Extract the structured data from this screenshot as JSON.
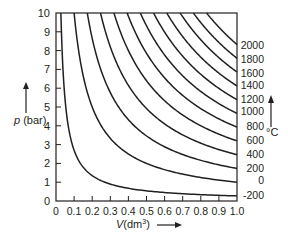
{
  "chart_data": {
    "type": "line",
    "title": "",
    "xlabel": "V (dm³)",
    "ylabel": "p (bar)",
    "secondary_label": "°C",
    "xlim": [
      0,
      1.0
    ],
    "ylim": [
      0,
      10
    ],
    "x_ticks": [
      "0",
      "0.1",
      "0.2",
      "0.3",
      "0.4",
      "0.5",
      "0.6",
      "0.7",
      "0.8",
      "0.9",
      "1.0"
    ],
    "y_ticks": [
      "0",
      "1",
      "2",
      "3",
      "4",
      "5",
      "6",
      "7",
      "8",
      "9",
      "10"
    ],
    "grid": false,
    "legend_position": "right (labels at curve ends)",
    "relation": "p = nR(T+273)/V, nR ≈ 0.00366 bar·dm³/K",
    "series": [
      {
        "name": "-200",
        "temperature_C": -200,
        "p_at_V1": 0.27
      },
      {
        "name": "0",
        "temperature_C": 0,
        "p_at_V1": 1.0
      },
      {
        "name": "200",
        "temperature_C": 200,
        "p_at_V1": 1.73
      },
      {
        "name": "400",
        "temperature_C": 400,
        "p_at_V1": 2.46
      },
      {
        "name": "600",
        "temperature_C": 600,
        "p_at_V1": 3.2
      },
      {
        "name": "800",
        "temperature_C": 800,
        "p_at_V1": 3.93
      },
      {
        "name": "1000",
        "temperature_C": 1000,
        "p_at_V1": 4.66
      },
      {
        "name": "1200",
        "temperature_C": 1200,
        "p_at_V1": 5.39
      },
      {
        "name": "1400",
        "temperature_C": 1400,
        "p_at_V1": 6.12
      },
      {
        "name": "1600",
        "temperature_C": 1600,
        "p_at_V1": 6.86
      },
      {
        "name": "1800",
        "temperature_C": 1800,
        "p_at_V1": 7.59
      },
      {
        "name": "2000",
        "temperature_C": 2000,
        "p_at_V1": 8.32
      }
    ],
    "right_labels": [
      {
        "text": "2000",
        "y": 45
      },
      {
        "text": "1800",
        "y": 59
      },
      {
        "text": "1600",
        "y": 73
      },
      {
        "text": "1400",
        "y": 85
      },
      {
        "text": "1200",
        "y": 99
      },
      {
        "text": "1000",
        "y": 111
      },
      {
        "text": "800",
        "y": 126
      },
      {
        "text": "600",
        "y": 140
      },
      {
        "text": "400",
        "y": 154
      },
      {
        "text": "200",
        "y": 168
      },
      {
        "text": "0",
        "y": 180
      },
      {
        "text": "-200",
        "y": 195
      }
    ]
  },
  "colors": {
    "ink": "#231f20",
    "background": "#ffffff"
  }
}
